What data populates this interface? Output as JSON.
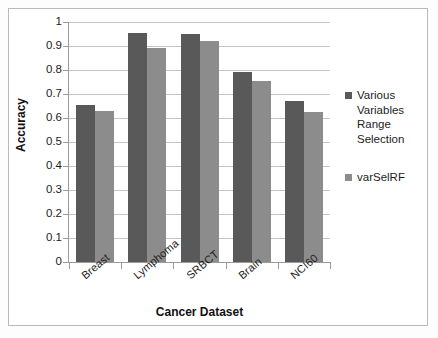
{
  "chart_data": {
    "type": "bar",
    "title": "",
    "xlabel": "Cancer Dataset",
    "ylabel": "Accuracy",
    "categories": [
      "Breast",
      "Lymphoma",
      "SRBCT",
      "Brain",
      "NCI60"
    ],
    "series": [
      {
        "name": "Various Variables Range Selection",
        "color": "#595959",
        "values": [
          0.655,
          0.955,
          0.95,
          0.79,
          0.67
        ]
      },
      {
        "name": "varSelRF",
        "color": "#8c8c8c",
        "values": [
          0.63,
          0.89,
          0.92,
          0.755,
          0.625
        ]
      }
    ],
    "ylim": [
      0,
      1
    ],
    "ytick_labels": [
      "1",
      "0.9",
      "0.8",
      "0.7",
      "0.6",
      "0.5",
      "0.4",
      "0.3",
      "0.2",
      "0.1",
      "0"
    ],
    "ytick_values": [
      1,
      0.9,
      0.8,
      0.7,
      0.6,
      0.5,
      0.4,
      0.3,
      0.2,
      0.1,
      0
    ],
    "grid": true,
    "legend_position": "right"
  },
  "legend": {
    "entries": [
      {
        "label": "Various Variables Range Selection",
        "swatch": "legend-swatch-series-0"
      },
      {
        "label": "varSelRF",
        "swatch": "legend-swatch-series-1"
      }
    ]
  }
}
